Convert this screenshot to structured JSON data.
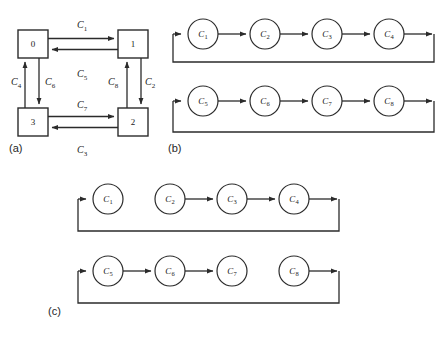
{
  "figure": {
    "background": "#ffffff",
    "line_color": "#2b2b2b",
    "text_color": "#1a1a1a"
  },
  "panels": [
    {
      "id": "a",
      "label": "(a)",
      "type": "task-graph-square",
      "nodes": [
        {
          "id": "n0",
          "label": "0",
          "x": 33,
          "y": 44
        },
        {
          "id": "n1",
          "label": "1",
          "x": 133,
          "y": 44
        },
        {
          "id": "n2",
          "label": "2",
          "x": 133,
          "y": 122
        },
        {
          "id": "n3",
          "label": "3",
          "x": 33,
          "y": 122
        }
      ],
      "edges": [
        {
          "id": "e1",
          "label": "C",
          "sub": "1",
          "from": "n0",
          "to": "n1",
          "direction": "right",
          "label_x": 81,
          "label_y": 31
        },
        {
          "id": "e5",
          "label": "C",
          "sub": "5",
          "from": "n1",
          "to": "n0",
          "direction": "left",
          "label_x": 81,
          "label_y": 76
        },
        {
          "id": "e2",
          "label": "C",
          "sub": "2",
          "from": "n1",
          "to": "n2",
          "direction": "down",
          "label_x": 147,
          "label_y": 86
        },
        {
          "id": "e8",
          "label": "C",
          "sub": "8",
          "from": "n2",
          "to": "n1",
          "direction": "up",
          "label_x": 113,
          "label_y": 86
        },
        {
          "id": "e7",
          "label": "C",
          "sub": "7",
          "from": "n3",
          "to": "n2",
          "direction": "right",
          "label_x": 81,
          "label_y": 110
        },
        {
          "id": "e3",
          "label": "C",
          "sub": "3",
          "from": "n2",
          "to": "n3",
          "direction": "left",
          "label_x": 81,
          "label_y": 152
        },
        {
          "id": "e4",
          "label": "C",
          "sub": "4",
          "from": "n3",
          "to": "n0",
          "direction": "up",
          "label_x": 16,
          "label_y": 86
        },
        {
          "id": "e6",
          "label": "C",
          "sub": "6",
          "from": "n0",
          "to": "n3",
          "direction": "down",
          "label_x": 50,
          "label_y": 86
        }
      ]
    },
    {
      "id": "b",
      "label": "(b)",
      "type": "pipeline-rings",
      "rings": [
        {
          "id": "ring-b-1",
          "nodes": [
            {
              "id": "c1",
              "label": "C",
              "sub": "1"
            },
            {
              "id": "c2",
              "label": "C",
              "sub": "2"
            },
            {
              "id": "c3",
              "label": "C",
              "sub": "3"
            },
            {
              "id": "c4",
              "label": "C",
              "sub": "4"
            }
          ],
          "links": [
            {
              "from": "c1",
              "to": "c2",
              "present": true
            },
            {
              "from": "c2",
              "to": "c3",
              "present": true
            },
            {
              "from": "c3",
              "to": "c4",
              "present": true
            }
          ],
          "feedback": true
        },
        {
          "id": "ring-b-2",
          "nodes": [
            {
              "id": "c5",
              "label": "C",
              "sub": "5"
            },
            {
              "id": "c6",
              "label": "C",
              "sub": "6"
            },
            {
              "id": "c7",
              "label": "C",
              "sub": "7"
            },
            {
              "id": "c8",
              "label": "C",
              "sub": "8"
            }
          ],
          "links": [
            {
              "from": "c5",
              "to": "c6",
              "present": true
            },
            {
              "from": "c6",
              "to": "c7",
              "present": true
            },
            {
              "from": "c7",
              "to": "c8",
              "present": true
            }
          ],
          "feedback": true
        }
      ]
    },
    {
      "id": "c",
      "label": "(c)",
      "type": "pipeline-rings",
      "rings": [
        {
          "id": "ring-c-1",
          "nodes": [
            {
              "id": "c1",
              "label": "C",
              "sub": "1"
            },
            {
              "id": "c2",
              "label": "C",
              "sub": "2"
            },
            {
              "id": "c3",
              "label": "C",
              "sub": "3"
            },
            {
              "id": "c4",
              "label": "C",
              "sub": "4"
            }
          ],
          "links": [
            {
              "from": "c1",
              "to": "c2",
              "present": false
            },
            {
              "from": "c2",
              "to": "c3",
              "present": true
            },
            {
              "from": "c3",
              "to": "c4",
              "present": true
            }
          ],
          "feedback": true
        },
        {
          "id": "ring-c-2",
          "nodes": [
            {
              "id": "c5",
              "label": "C",
              "sub": "5"
            },
            {
              "id": "c6",
              "label": "C",
              "sub": "6"
            },
            {
              "id": "c7",
              "label": "C",
              "sub": "7"
            },
            {
              "id": "c8",
              "label": "C",
              "sub": "8"
            }
          ],
          "links": [
            {
              "from": "c5",
              "to": "c6",
              "present": true
            },
            {
              "from": "c6",
              "to": "c7",
              "present": true
            },
            {
              "from": "c7",
              "to": "c8",
              "present": false
            }
          ],
          "feedback": true
        }
      ]
    }
  ]
}
